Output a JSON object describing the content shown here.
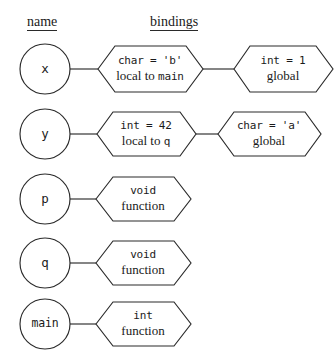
{
  "headers": {
    "name": "name",
    "bindings": "bindings"
  },
  "rows": [
    {
      "id": "x",
      "name": "x",
      "bindings": [
        {
          "type": "char = 'b'",
          "scope_prefix": "local to ",
          "scope_ident": "main",
          "scope_full": "local to main"
        },
        {
          "type": "int = 1",
          "scope_prefix": "",
          "scope_ident": "",
          "scope_full": "global"
        }
      ]
    },
    {
      "id": "y",
      "name": "y",
      "bindings": [
        {
          "type": "int = 42",
          "scope_prefix": "local to ",
          "scope_ident": "q",
          "scope_full": "local to q"
        },
        {
          "type": "char = 'a'",
          "scope_prefix": "",
          "scope_ident": "",
          "scope_full": "global"
        }
      ]
    },
    {
      "id": "p",
      "name": "p",
      "bindings": [
        {
          "type": "void",
          "scope_prefix": "",
          "scope_ident": "",
          "scope_full": "function"
        }
      ]
    },
    {
      "id": "q",
      "name": "q",
      "bindings": [
        {
          "type": "void",
          "scope_prefix": "",
          "scope_ident": "",
          "scope_full": "function"
        }
      ]
    },
    {
      "id": "main",
      "name": "main",
      "bindings": [
        {
          "type": "int",
          "scope_prefix": "",
          "scope_ident": "",
          "scope_full": "function"
        }
      ]
    }
  ],
  "style": {
    "stroke": "#2a2a2a",
    "background": "#ffffff"
  }
}
